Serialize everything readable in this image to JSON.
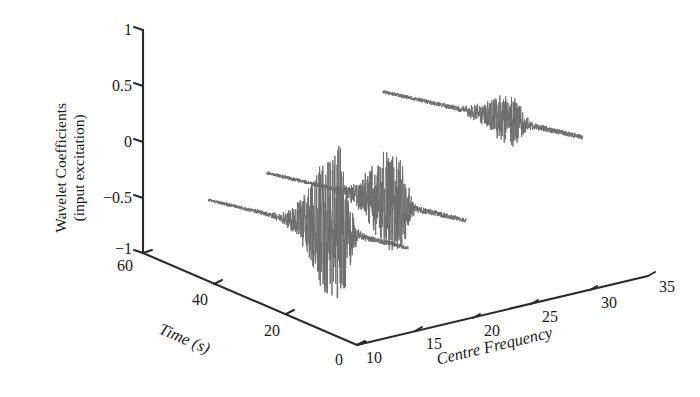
{
  "chart_data": {
    "type": "line",
    "title": "",
    "subtitle": "",
    "projection": "3d-waterfall",
    "zlabel_line1": "Wavelet Coefficients",
    "zlabel_line2": "(input excitation)",
    "zlabel": "Wavelet Coefficients (input excitation)",
    "xlabel": "Time (s)",
    "ylabel": "Centre Frequency",
    "grid": false,
    "legend": "none",
    "zlim": [
      -1,
      1
    ],
    "xlim": [
      0,
      60
    ],
    "ylim": [
      10,
      35
    ],
    "z_ticks": [
      "1",
      "0.5",
      "0",
      "-0.5",
      "-1"
    ],
    "z_tick_values": [
      1,
      0.5,
      0,
      -0.5,
      -1
    ],
    "x_ticks": [
      "60",
      "40",
      "20",
      "0"
    ],
    "x_tick_values": [
      60,
      40,
      20,
      0
    ],
    "y_ticks": [
      "10",
      "15",
      "20",
      "25",
      "30",
      "35"
    ],
    "y_tick_values": [
      10,
      15,
      20,
      25,
      30,
      35
    ],
    "trace_color": "#6e6e6e",
    "axis_color": "#2a2a2a",
    "background_color": "#ffffff",
    "series": [
      {
        "name": "wavelet-trace-low-frequency",
        "centre_frequency": 15,
        "description": "Decaying oscillatory wavelet coefficient trace with large burst near t=22 s",
        "burst_time": 22,
        "burst_amplitude": 0.78,
        "baseline_start": -0.28,
        "baseline_end": -0.62
      },
      {
        "name": "wavelet-trace-mid-frequency",
        "centre_frequency": 20,
        "description": "Decaying oscillatory wavelet coefficient trace with medium burst near t=22 s",
        "burst_time": 22,
        "burst_amplitude": 0.52,
        "baseline_start": -0.16,
        "baseline_end": -0.5
      },
      {
        "name": "wavelet-trace-high-frequency",
        "centre_frequency": 30,
        "description": "Near-flat trace with small burst near t=22 s",
        "burst_time": 22,
        "burst_amplitude": 0.22,
        "baseline_start": 0.34,
        "baseline_end": -0.02
      }
    ]
  },
  "axes": {
    "z_tick_labels": [
      "1",
      "0.5",
      "0",
      "−0.5",
      "−1"
    ],
    "x_tick_labels": [
      "60",
      "40",
      "20",
      "0"
    ],
    "y_tick_labels": [
      "10",
      "15",
      "20",
      "25",
      "30",
      "35"
    ],
    "x_title": "Time (s)",
    "y_title": "Centre Frequency",
    "z_title_line1": "Wavelet Coefficients",
    "z_title_line2": "(input excitation)"
  }
}
